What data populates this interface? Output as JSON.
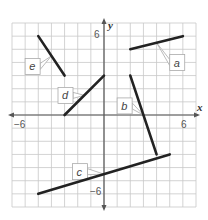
{
  "chart_data": {
    "type": "line",
    "title": "",
    "xlabel": "x",
    "ylabel": "y",
    "xlim": [
      -7,
      7
    ],
    "ylim": [
      -7,
      7
    ],
    "grid": true,
    "tick_labels": {
      "x_neg": "−6",
      "x_pos": "6",
      "y_pos": "6",
      "y_neg": "−6"
    },
    "segments": [
      {
        "name": "a",
        "from": [
          2,
          5
        ],
        "to": [
          6,
          6
        ],
        "label_pos": [
          5,
          4.6
        ]
      },
      {
        "name": "b",
        "from": [
          2,
          3
        ],
        "to": [
          4,
          -3
        ],
        "label_pos": [
          1,
          1.3
        ]
      },
      {
        "name": "c",
        "from": [
          -5,
          -6
        ],
        "to": [
          5,
          -3
        ],
        "label_pos": [
          -2.4,
          -3.7
        ]
      },
      {
        "name": "d",
        "from": [
          -3,
          0
        ],
        "to": [
          0,
          3
        ],
        "label_pos": [
          -3.5,
          2.1
        ]
      },
      {
        "name": "e",
        "from": [
          -5,
          6
        ],
        "to": [
          -3,
          3
        ],
        "label_pos": [
          -6,
          4.3
        ]
      }
    ]
  },
  "axes": {
    "x_label": "x",
    "y_label": "y",
    "x_neg_tick": "−6",
    "x_pos_tick": "6",
    "y_pos_tick": "6",
    "y_neg_tick": "−6"
  },
  "labels": {
    "a": "a",
    "b": "b",
    "c": "c",
    "d": "d",
    "e": "e"
  },
  "colors": {
    "grid": "#c8c8c8",
    "axis": "#555555",
    "segment": "#222222",
    "label_box_border": "#aaaaaa"
  }
}
